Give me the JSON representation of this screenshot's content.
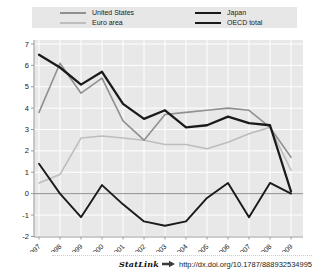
{
  "chart_data": {
    "type": "line",
    "x": [
      "1997",
      "1998",
      "1999",
      "2000",
      "2001",
      "2002",
      "2003",
      "2004",
      "2005",
      "2006",
      "2007",
      "2008",
      "2009"
    ],
    "series": [
      {
        "name": "United States",
        "color": "#909090",
        "width": 1.6,
        "values": [
          3.8,
          6.1,
          4.7,
          5.4,
          3.4,
          2.5,
          3.7,
          3.8,
          3.9,
          4.0,
          3.9,
          3.1,
          1.7
        ]
      },
      {
        "name": "Euro area",
        "color": "#bdbdbd",
        "width": 1.6,
        "values": [
          0.5,
          0.9,
          2.6,
          2.7,
          2.6,
          2.5,
          2.3,
          2.3,
          2.1,
          2.4,
          2.8,
          3.1,
          1.1
        ]
      },
      {
        "name": "Japan",
        "color": "#1a1a1a",
        "width": 1.9,
        "values": [
          1.4,
          0.0,
          -1.1,
          0.4,
          -0.5,
          -1.3,
          -1.5,
          -1.3,
          -0.2,
          0.5,
          -1.1,
          0.5,
          0.0
        ]
      },
      {
        "name": "OECD total",
        "color": "#1a1a1a",
        "width": 2.3,
        "values": [
          6.5,
          5.9,
          5.1,
          5.7,
          4.2,
          3.5,
          3.9,
          3.1,
          3.2,
          3.6,
          3.3,
          3.2,
          0.1
        ]
      }
    ],
    "title": "",
    "xlabel": "",
    "ylabel": "",
    "ylim": [
      -2,
      7
    ],
    "yticks": [
      7,
      6,
      5,
      4,
      3,
      2,
      1,
      0,
      -1,
      -2
    ],
    "grid": true,
    "zero_line": true,
    "legend_position": "top",
    "plot_bg": "#e8e8e8",
    "grid_color": "#ffffff",
    "axis_color": "#999999",
    "zero_line_color": "#8c8c8c"
  },
  "footer": {
    "statlink_label": "StatLink",
    "url": "http://dx.doi.org/10.1787/888932534995"
  }
}
